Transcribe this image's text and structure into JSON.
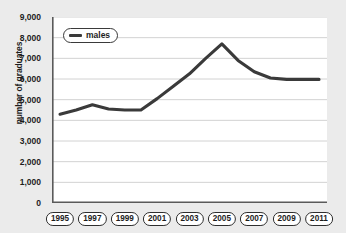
{
  "chart_data": {
    "type": "line",
    "title": "",
    "xlabel": "",
    "ylabel": "number of graduates",
    "ylim": [
      0,
      9000
    ],
    "xlim": [
      1995,
      2011
    ],
    "grid": true,
    "legend_position": "top-left",
    "y_ticks": [
      0,
      1000,
      2000,
      3000,
      4000,
      5000,
      6000,
      7000,
      8000,
      9000
    ],
    "y_tick_labels": [
      "0",
      "1,000",
      "2,000",
      "3,000",
      "4,000",
      "5,000",
      "6,000",
      "7,000",
      "8,000",
      "9,000"
    ],
    "x_ticks": [
      1995,
      1996,
      1997,
      1998,
      1999,
      2000,
      2001,
      2002,
      2003,
      2004,
      2005,
      2006,
      2007,
      2008,
      2009,
      2010,
      2011
    ],
    "x_tick_labels": [
      "1995",
      "1997",
      "1999",
      "2001",
      "2003",
      "2005",
      "2007",
      "2009",
      "2011"
    ],
    "x_labelled_ticks": [
      1995,
      1997,
      1999,
      2001,
      2003,
      2005,
      2007,
      2009,
      2011
    ],
    "series": [
      {
        "name": "males",
        "color": "#3a3a3a",
        "x": [
          1995,
          1996,
          1997,
          1998,
          1999,
          2000,
          2001,
          2002,
          2003,
          2004,
          2005,
          2006,
          2007,
          2008,
          2009,
          2010,
          2011
        ],
        "values": [
          4300,
          4500,
          4750,
          4550,
          4500,
          4500,
          5050,
          5650,
          6250,
          7000,
          7700,
          6900,
          6350,
          6050,
          5980,
          5980,
          5980
        ]
      }
    ],
    "legend": [
      {
        "label": "males",
        "color": "#3a3a3a"
      }
    ]
  },
  "colors": {
    "page_background": "#ebebeb",
    "plot_background": "#ffffff",
    "gridline": "#d2d2d2",
    "axis": "#5a5a5a",
    "text": "#1d1d1d",
    "line": "#3a3a3a"
  }
}
